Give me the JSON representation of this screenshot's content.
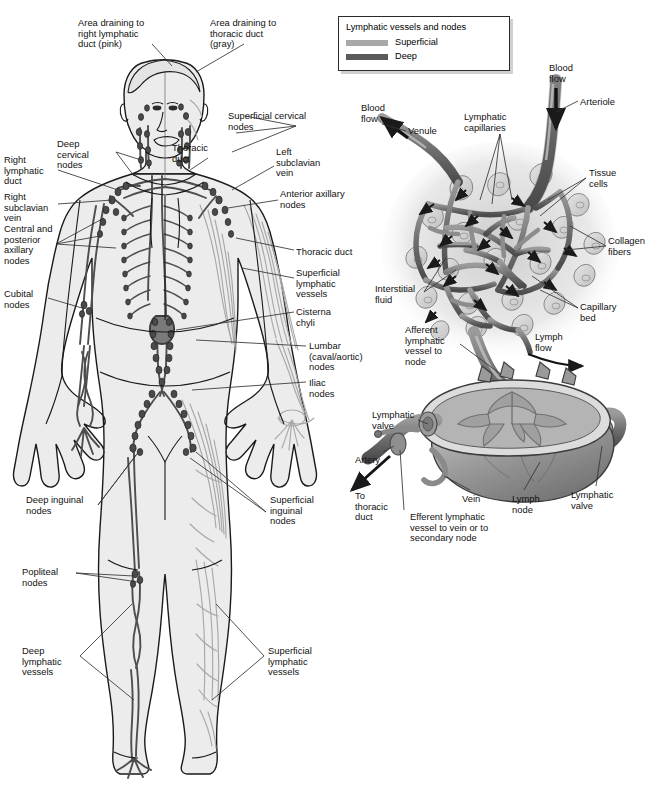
{
  "figure": {
    "background": "#ffffff",
    "colors": {
      "superficial": "#a8a8a8",
      "deep": "#5a5a5a",
      "outline": "#1a1a1a",
      "body_fill": "#ececec",
      "tissue_fill": "#d8d8d8",
      "leader": "#333333"
    }
  },
  "legend": {
    "title": "Lymphatic vessels and nodes",
    "items": [
      {
        "label": "Superficial",
        "color": "#a8a8a8"
      },
      {
        "label": "Deep",
        "color": "#5a5a5a"
      }
    ]
  },
  "body_diagram": {
    "labels": [
      {
        "id": "area-right-duct",
        "text": "Area draining to\nright lymphatic\nduct (pink)",
        "x": 78,
        "y": 18,
        "align": "left"
      },
      {
        "id": "area-thoracic-duct",
        "text": "Area draining to\nthoracic duct\n(gray)",
        "x": 210,
        "y": 18,
        "align": "left"
      },
      {
        "id": "superficial-cervical-nodes",
        "text": "Superficial cervical\nnodes",
        "x": 228,
        "y": 111,
        "align": "left"
      },
      {
        "id": "deep-cervical-nodes",
        "text": "Deep\ncervical\nnodes",
        "x": 57,
        "y": 139,
        "align": "left"
      },
      {
        "id": "thoracic-duct-upper",
        "text": "Thoracic\nduct",
        "x": 172,
        "y": 143,
        "align": "left"
      },
      {
        "id": "left-subclavian-vein",
        "text": "Left\nsubclavian\nvein",
        "x": 276,
        "y": 147,
        "align": "left"
      },
      {
        "id": "right-lymphatic-duct",
        "text": "Right\nlymphatic\nduct",
        "x": 4,
        "y": 155,
        "align": "left"
      },
      {
        "id": "anterior-axillary-nodes",
        "text": "Anterior axillary\nnodes",
        "x": 280,
        "y": 189,
        "align": "left"
      },
      {
        "id": "right-subclavian-vein",
        "text": "Right\nsubclavian\nvein",
        "x": 4,
        "y": 192,
        "align": "left"
      },
      {
        "id": "central-posterior-axillary-nodes",
        "text": "Central and\nposterior\naxillary\nnodes",
        "x": 4,
        "y": 224,
        "align": "left"
      },
      {
        "id": "thoracic-duct-lower",
        "text": "Thoracic duct",
        "x": 296,
        "y": 247,
        "align": "left"
      },
      {
        "id": "superficial-lymphatic-vessels-trunk",
        "text": "Superficial\nlymphatic\nvessels",
        "x": 296,
        "y": 268,
        "align": "left"
      },
      {
        "id": "cubital-nodes",
        "text": "Cubital\nnodes",
        "x": 4,
        "y": 289,
        "align": "left"
      },
      {
        "id": "cisterna-chyli",
        "text": "Cisterna\nchyli",
        "x": 296,
        "y": 307,
        "align": "left"
      },
      {
        "id": "lumbar-nodes",
        "text": "Lumbar\n(caval/aortic)\nnodes",
        "x": 309,
        "y": 341,
        "align": "left"
      },
      {
        "id": "iliac-nodes",
        "text": "Iliac\nnodes",
        "x": 309,
        "y": 378,
        "align": "left"
      },
      {
        "id": "deep-inguinal-nodes",
        "text": "Deep inguinal\nnodes",
        "x": 26,
        "y": 495,
        "align": "left"
      },
      {
        "id": "superficial-inguinal-nodes",
        "text": "Superficial\ninguinal\nnodes",
        "x": 270,
        "y": 495,
        "align": "left"
      },
      {
        "id": "popliteal-nodes",
        "text": "Popliteal\nnodes",
        "x": 22,
        "y": 567,
        "align": "left"
      },
      {
        "id": "deep-lymphatic-vessels",
        "text": "Deep\nlymphatic\nvessels",
        "x": 22,
        "y": 646,
        "align": "left"
      },
      {
        "id": "superficial-lymphatic-vessels-leg",
        "text": "Superficial\nlymphatic\nvessels",
        "x": 268,
        "y": 646,
        "align": "left"
      }
    ]
  },
  "capillary_diagram": {
    "labels": [
      {
        "id": "blood-flow-arteriole",
        "text": "Blood\nflow",
        "x": 549,
        "y": 63,
        "align": "left"
      },
      {
        "id": "arteriole",
        "text": "Arteriole",
        "x": 580,
        "y": 97,
        "align": "left"
      },
      {
        "id": "blood-flow-venule",
        "text": "Blood\nflow",
        "x": 361,
        "y": 103,
        "align": "left"
      },
      {
        "id": "lymphatic-capillaries",
        "text": "Lymphatic\ncapillaries",
        "x": 464,
        "y": 112,
        "align": "left"
      },
      {
        "id": "venule",
        "text": "Venule",
        "x": 408,
        "y": 126,
        "align": "left"
      },
      {
        "id": "tissue-cells",
        "text": "Tissue\ncells",
        "x": 589,
        "y": 168,
        "align": "left"
      },
      {
        "id": "collagen-fibers",
        "text": "Collagen\nfibers",
        "x": 608,
        "y": 236,
        "align": "left"
      },
      {
        "id": "interstitial-fluid",
        "text": "Interstitial\nfluid",
        "x": 375,
        "y": 284,
        "align": "left"
      },
      {
        "id": "capillary-bed",
        "text": "Capillary\nbed",
        "x": 580,
        "y": 302,
        "align": "left"
      },
      {
        "id": "afferent-lymphatic-vessel",
        "text": "Afferent\nlymphatic\nvessel to\nnode",
        "x": 405,
        "y": 325,
        "align": "left"
      },
      {
        "id": "lymph-flow",
        "text": "Lymph\nflow",
        "x": 535,
        "y": 332,
        "align": "left"
      }
    ]
  },
  "lymph_node_diagram": {
    "labels": [
      {
        "id": "lymphatic-valve-left",
        "text": "Lymphatic\nvalve",
        "x": 372,
        "y": 410,
        "align": "left"
      },
      {
        "id": "artery",
        "text": "Artery",
        "x": 355,
        "y": 455,
        "align": "left"
      },
      {
        "id": "to-thoracic-duct",
        "text": "To\nthoracic\nduct",
        "x": 355,
        "y": 491,
        "align": "left"
      },
      {
        "id": "efferent-lymphatic-vessel",
        "text": "Efferent lymphatic\nvessel to vein or to\nsecondary node",
        "x": 410,
        "y": 512,
        "align": "left"
      },
      {
        "id": "vein",
        "text": "Vein",
        "x": 462,
        "y": 494,
        "align": "left"
      },
      {
        "id": "lymph-node",
        "text": "Lymph\nnode",
        "x": 512,
        "y": 494,
        "align": "left"
      },
      {
        "id": "lymphatic-valve-right",
        "text": "Lymphatic\nvalve",
        "x": 571,
        "y": 490,
        "align": "left"
      }
    ]
  }
}
